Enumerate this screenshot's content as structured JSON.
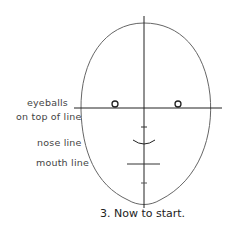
{
  "labels": {
    "eyeballs_line1": "eyeballs",
    "eyeballs_line2": "on top of line",
    "nose": "nose line",
    "mouth": "mouth line"
  },
  "caption": "3. Now to start.",
  "colors": {
    "stroke": "#333333",
    "text": "#444444"
  }
}
